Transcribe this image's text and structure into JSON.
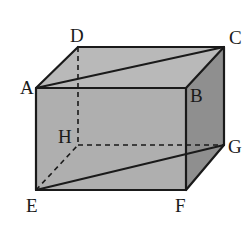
{
  "figure": {
    "name": "cuboid-abcd-efgh",
    "type": "3d-rectangular-prism",
    "canvas": {
      "width": 252,
      "height": 229,
      "background": "#ffffff"
    },
    "colors": {
      "front_face": "#afafaf",
      "top_face": "#b9b9b9",
      "right_face": "#8f8f8f",
      "edge": "#1a1a1a",
      "hidden_edge": "#1a1a1a",
      "label": "#1a1a1a",
      "background": "#ffffff"
    },
    "vertices": [
      {
        "id": "A",
        "label": "A",
        "x": 36,
        "y": 88,
        "label_x": 20,
        "label_y": 78,
        "hidden": false
      },
      {
        "id": "B",
        "label": "B",
        "x": 186,
        "y": 88,
        "label_x": 190,
        "label_y": 86,
        "hidden": false
      },
      {
        "id": "C",
        "label": "C",
        "x": 224,
        "y": 47,
        "label_x": 229,
        "label_y": 28,
        "hidden": false
      },
      {
        "id": "D",
        "label": "D",
        "x": 78,
        "y": 47,
        "label_x": 70,
        "label_y": 26,
        "hidden": false
      },
      {
        "id": "E",
        "label": "E",
        "x": 36,
        "y": 190,
        "label_x": 26,
        "label_y": 196,
        "hidden": false
      },
      {
        "id": "F",
        "label": "F",
        "x": 186,
        "y": 190,
        "label_x": 175,
        "label_y": 196,
        "hidden": false
      },
      {
        "id": "G",
        "label": "G",
        "x": 224,
        "y": 145,
        "label_x": 228,
        "label_y": 137,
        "hidden": false
      },
      {
        "id": "H",
        "label": "H",
        "x": 78,
        "y": 145,
        "label_x": 58,
        "label_y": 127,
        "hidden": true
      }
    ],
    "faces": [
      {
        "id": "front",
        "name": "face-abfe",
        "points": "36,88 186,88 186,190 36,190",
        "fill": "#afafaf"
      },
      {
        "id": "top",
        "name": "face-adcb",
        "points": "36,88 78,47 224,47 186,88",
        "fill": "#b9b9b9"
      },
      {
        "id": "right",
        "name": "face-bcgf",
        "points": "186,88 224,47 224,145 186,190",
        "fill": "#8f8f8f"
      }
    ],
    "edges_solid": [
      {
        "id": "AB",
        "name": "edge-ab",
        "x1": 36,
        "y1": 88,
        "x2": 186,
        "y2": 88
      },
      {
        "id": "BF",
        "name": "edge-bf",
        "x1": 186,
        "y1": 88,
        "x2": 186,
        "y2": 190
      },
      {
        "id": "FE",
        "name": "edge-fe",
        "x1": 186,
        "y1": 190,
        "x2": 36,
        "y2": 190
      },
      {
        "id": "EA",
        "name": "edge-ea",
        "x1": 36,
        "y1": 190,
        "x2": 36,
        "y2": 88
      },
      {
        "id": "AD",
        "name": "edge-ad",
        "x1": 36,
        "y1": 88,
        "x2": 78,
        "y2": 47
      },
      {
        "id": "DC",
        "name": "edge-dc",
        "x1": 78,
        "y1": 47,
        "x2": 224,
        "y2": 47
      },
      {
        "id": "CB",
        "name": "edge-cb",
        "x1": 224,
        "y1": 47,
        "x2": 186,
        "y2": 88
      },
      {
        "id": "CG",
        "name": "edge-cg",
        "x1": 224,
        "y1": 47,
        "x2": 224,
        "y2": 145
      },
      {
        "id": "GF",
        "name": "edge-gf",
        "x1": 224,
        "y1": 145,
        "x2": 186,
        "y2": 190
      }
    ],
    "edges_hidden": [
      {
        "id": "DH",
        "name": "edge-dh-hidden",
        "x1": 78,
        "y1": 47,
        "x2": 78,
        "y2": 145
      },
      {
        "id": "HG",
        "name": "edge-hg-hidden",
        "x1": 78,
        "y1": 145,
        "x2": 224,
        "y2": 145
      }
    ],
    "diagonals_solid": [
      {
        "id": "AC",
        "name": "diagonal-ac",
        "x1": 36,
        "y1": 88,
        "x2": 224,
        "y2": 47
      },
      {
        "id": "EG",
        "name": "diagonal-eg",
        "x1": 36,
        "y1": 190,
        "x2": 224,
        "y2": 145
      }
    ],
    "diagonals_hidden": [
      {
        "id": "EH",
        "name": "diagonal-eh-hidden",
        "x1": 36,
        "y1": 190,
        "x2": 78,
        "y2": 145
      }
    ]
  }
}
